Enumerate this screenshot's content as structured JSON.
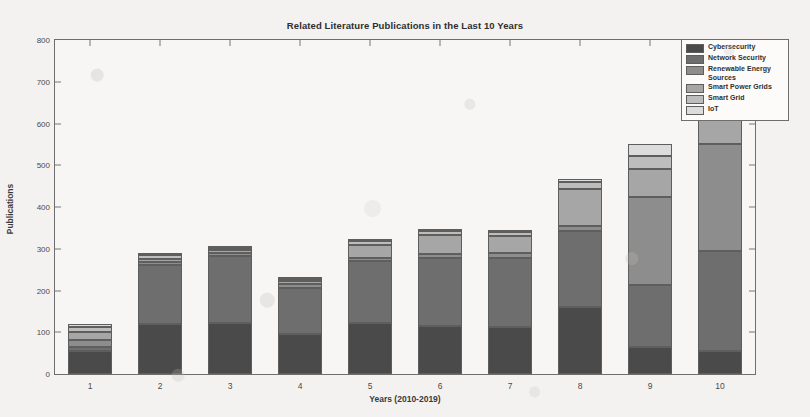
{
  "chart_data": {
    "type": "bar",
    "stacked": true,
    "title": "Related Literature Publications in the Last 10 Years",
    "xlabel": "Years (2010-2019)",
    "ylabel": "Publications",
    "categories": [
      "1",
      "2",
      "3",
      "4",
      "5",
      "6",
      "7",
      "8",
      "9",
      "10"
    ],
    "ylim": [
      0,
      800
    ],
    "yticks": [
      0,
      100,
      200,
      300,
      400,
      500,
      600,
      700,
      800
    ],
    "grid": false,
    "legend_position": "top-right",
    "series": [
      {
        "name": "Cybersecurity",
        "color": "#4a4a4a",
        "values": [
          55,
          120,
          122,
          95,
          122,
          115,
          112,
          160,
          65,
          55
        ]
      },
      {
        "name": "Network Security",
        "color": "#6e6e6e",
        "values": [
          10,
          140,
          160,
          110,
          148,
          163,
          167,
          182,
          148,
          240
        ]
      },
      {
        "name": "Renewable Energy Sources",
        "color": "#8d8d8d",
        "values": [
          17,
          8,
          8,
          10,
          8,
          10,
          10,
          12,
          210,
          255
        ]
      },
      {
        "name": "Smart Power Grids",
        "color": "#a6a6a6",
        "values": [
          18,
          8,
          8,
          8,
          32,
          45,
          42,
          90,
          67,
          67
        ]
      },
      {
        "name": "Smart Grid",
        "color": "#bdbdbd",
        "values": [
          12,
          8,
          5,
          5,
          8,
          10,
          10,
          15,
          32,
          83
        ]
      },
      {
        "name": "IoT",
        "color": "#dcdcdc",
        "values": [
          8,
          5,
          2,
          2,
          5,
          2,
          2,
          8,
          28,
          30
        ]
      }
    ],
    "totals": [
      120,
      289,
      305,
      230,
      323,
      345,
      343,
      467,
      550,
      730
    ]
  }
}
